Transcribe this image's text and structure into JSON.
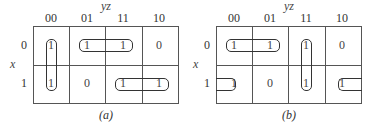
{
  "diagram": {
    "type": "karnaugh_map",
    "column_variable": "yz",
    "row_variable": "x",
    "column_labels": [
      "00",
      "01",
      "11",
      "10"
    ],
    "row_labels": [
      "0",
      "1"
    ],
    "maps": [
      {
        "caption": "(a)",
        "cells": [
          [
            "1",
            "1",
            "1",
            "0"
          ],
          [
            "1",
            "0",
            "1",
            "1"
          ]
        ],
        "groups": [
          {
            "description": "vertical pair column 00 (rows 0-1)"
          },
          {
            "description": "horizontal pair row 0, columns 01-11"
          },
          {
            "description": "horizontal pair row 1, columns 11-10"
          }
        ]
      },
      {
        "caption": "(b)",
        "cells": [
          [
            "1",
            "1",
            "1",
            "0"
          ],
          [
            "1",
            "0",
            "1",
            "1"
          ]
        ],
        "groups": [
          {
            "description": "horizontal pair row 0, columns 00-01"
          },
          {
            "description": "vertical pair column 11 (rows 0-1)"
          },
          {
            "description": "wrap-around pair row 1, columns 10-00"
          }
        ]
      }
    ]
  }
}
